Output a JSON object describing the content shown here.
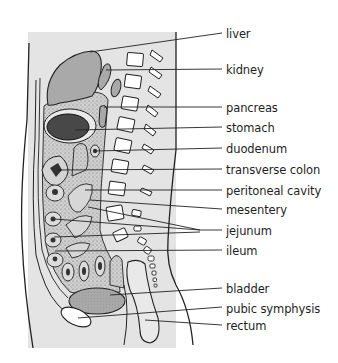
{
  "figure": {
    "type": "anatomical sagittal section diagram",
    "colors": {
      "background_panel": "#e4e4e4",
      "organ_fill": "#a9a9a9",
      "dark_organ_fill": "#555555",
      "outline": "#222222",
      "bone_fill": "#ffffff",
      "label_text": "#1e1e1e"
    }
  },
  "labels": [
    {
      "id": "liver",
      "text": "liver",
      "y": 33
    },
    {
      "id": "kidney",
      "text": "kidney",
      "y": 69
    },
    {
      "id": "pancreas",
      "text": "pancreas",
      "y": 107
    },
    {
      "id": "stomach",
      "text": "stomach",
      "y": 127
    },
    {
      "id": "duodenum",
      "text": "duodenum",
      "y": 148
    },
    {
      "id": "transverse-colon",
      "text": "transverse colon",
      "y": 169
    },
    {
      "id": "peritoneal-cavity",
      "text": "peritoneal cavity",
      "y": 190
    },
    {
      "id": "mesentery",
      "text": "mesentery",
      "y": 209
    },
    {
      "id": "jejunum",
      "text": "jejunum",
      "y": 230
    },
    {
      "id": "ileum",
      "text": "ileum",
      "y": 250
    },
    {
      "id": "bladder",
      "text": "bladder",
      "y": 288
    },
    {
      "id": "pubic-symphysis",
      "text": "pubic symphysis",
      "y": 308
    },
    {
      "id": "rectum",
      "text": "rectum",
      "y": 325
    }
  ]
}
